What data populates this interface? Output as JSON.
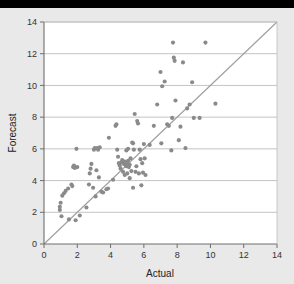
{
  "figure": {
    "background_color": "#e9e9e9",
    "plot_background_color": "#ffffff",
    "top_band_color": "#000000",
    "point_color": "#8a8a8a",
    "gridline_color": "#bdbdbd",
    "axis_color": "#6e6e6e",
    "reference_line_color": "#a0a0a0"
  },
  "chart_data": {
    "type": "scatter",
    "title": "",
    "xlabel": "Actual",
    "ylabel": "Forecast",
    "xlim": [
      0,
      14
    ],
    "ylim": [
      0,
      14
    ],
    "xticks": [
      0,
      2,
      4,
      6,
      8,
      10,
      12,
      14
    ],
    "yticks": [
      0,
      2,
      4,
      6,
      8,
      10,
      12,
      14
    ],
    "xtick_labels": [
      "0",
      "2",
      "4",
      "6",
      "8",
      "10",
      "12",
      "14"
    ],
    "ytick_labels": [
      "0",
      "2",
      "4",
      "6",
      "8",
      "10",
      "12",
      "14"
    ],
    "grid": "horizontal",
    "legend": "none",
    "annotations": [],
    "reference_line": {
      "name": "identity-line",
      "from": [
        0,
        0
      ],
      "to": [
        14,
        14
      ]
    },
    "series": [
      {
        "name": "Forecast vs Actual",
        "marker": "circle",
        "marker_size": 3,
        "color": "#8a8a8a",
        "points": [
          [
            0.95,
            2.35
          ],
          [
            0.95,
            2.15
          ],
          [
            1.0,
            2.6
          ],
          [
            1.05,
            1.75
          ],
          [
            1.1,
            3.05
          ],
          [
            1.2,
            3.2
          ],
          [
            1.3,
            3.35
          ],
          [
            1.45,
            3.5
          ],
          [
            1.5,
            1.55
          ],
          [
            1.65,
            3.75
          ],
          [
            1.7,
            3.65
          ],
          [
            1.75,
            4.85
          ],
          [
            1.8,
            4.95
          ],
          [
            1.85,
            4.8
          ],
          [
            1.9,
            1.5
          ],
          [
            1.95,
            6.0
          ],
          [
            2.0,
            4.85
          ],
          [
            2.15,
            1.8
          ],
          [
            2.55,
            2.3
          ],
          [
            2.7,
            3.75
          ],
          [
            2.75,
            4.45
          ],
          [
            2.8,
            4.75
          ],
          [
            2.85,
            5.05
          ],
          [
            2.95,
            3.55
          ],
          [
            3.0,
            5.95
          ],
          [
            3.05,
            6.05
          ],
          [
            3.1,
            3.0
          ],
          [
            3.15,
            4.65
          ],
          [
            3.2,
            6.05
          ],
          [
            3.25,
            5.95
          ],
          [
            3.3,
            4.2
          ],
          [
            3.35,
            6.1
          ],
          [
            3.45,
            3.3
          ],
          [
            3.55,
            3.25
          ],
          [
            3.75,
            3.45
          ],
          [
            3.85,
            3.5
          ],
          [
            3.9,
            6.7
          ],
          [
            4.15,
            4.05
          ],
          [
            4.3,
            7.45
          ],
          [
            4.35,
            7.55
          ],
          [
            4.4,
            5.95
          ],
          [
            4.45,
            5.5
          ],
          [
            4.5,
            5.1
          ],
          [
            4.55,
            4.95
          ],
          [
            4.6,
            4.75
          ],
          [
            4.65,
            5.15
          ],
          [
            4.7,
            5.3
          ],
          [
            4.75,
            4.55
          ],
          [
            4.8,
            5.05
          ],
          [
            4.85,
            5.2
          ],
          [
            4.85,
            4.35
          ],
          [
            4.9,
            5.0
          ],
          [
            4.95,
            5.9
          ],
          [
            4.95,
            4.9
          ],
          [
            5.0,
            5.1
          ],
          [
            5.0,
            4.45
          ],
          [
            5.05,
            6.0
          ],
          [
            5.05,
            5.25
          ],
          [
            5.1,
            4.85
          ],
          [
            5.15,
            5.0
          ],
          [
            5.15,
            4.15
          ],
          [
            5.2,
            5.4
          ],
          [
            5.25,
            4.6
          ],
          [
            5.3,
            6.4
          ],
          [
            5.35,
            6.35
          ],
          [
            5.35,
            3.55
          ],
          [
            5.4,
            5.95
          ],
          [
            5.45,
            8.2
          ],
          [
            5.5,
            4.55
          ],
          [
            5.55,
            4.9
          ],
          [
            5.6,
            7.75
          ],
          [
            5.65,
            7.6
          ],
          [
            5.7,
            4.45
          ],
          [
            5.75,
            5.95
          ],
          [
            5.8,
            5.35
          ],
          [
            5.85,
            3.7
          ],
          [
            5.9,
            5.1
          ],
          [
            5.95,
            4.5
          ],
          [
            6.0,
            6.3
          ],
          [
            6.05,
            5.4
          ],
          [
            6.1,
            4.35
          ],
          [
            6.35,
            6.25
          ],
          [
            6.6,
            7.45
          ],
          [
            6.8,
            8.8
          ],
          [
            7.0,
            10.85
          ],
          [
            7.05,
            6.35
          ],
          [
            7.1,
            9.95
          ],
          [
            7.25,
            10.25
          ],
          [
            7.4,
            7.55
          ],
          [
            7.5,
            7.45
          ],
          [
            7.65,
            5.9
          ],
          [
            7.7,
            7.95
          ],
          [
            7.75,
            12.7
          ],
          [
            7.8,
            11.75
          ],
          [
            7.85,
            11.55
          ],
          [
            7.9,
            9.05
          ],
          [
            8.1,
            6.55
          ],
          [
            8.2,
            7.4
          ],
          [
            8.35,
            11.45
          ],
          [
            8.5,
            6.05
          ],
          [
            8.6,
            8.55
          ],
          [
            8.75,
            8.8
          ],
          [
            8.9,
            10.2
          ],
          [
            9.0,
            7.95
          ],
          [
            9.35,
            7.95
          ],
          [
            9.7,
            12.7
          ],
          [
            10.3,
            8.85
          ]
        ]
      }
    ]
  },
  "axes": {
    "x_title": "Actual",
    "y_title": "Forecast"
  }
}
